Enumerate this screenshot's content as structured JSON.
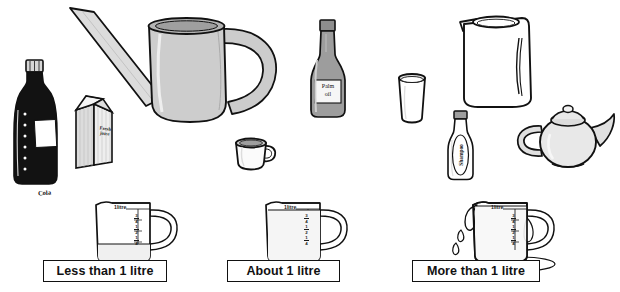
{
  "worksheet": {
    "title": "Capacity comparison worksheet",
    "unit": "litre"
  },
  "categories": [
    {
      "id": "less",
      "label": "Less than 1 litre",
      "jug_fill": "quarter",
      "overflowing": false
    },
    {
      "id": "about",
      "label": "About 1 litre",
      "jug_fill": "full",
      "overflowing": false
    },
    {
      "id": "more",
      "label": "More than 1 litre",
      "jug_fill": "overflow",
      "overflowing": true
    }
  ],
  "jug_scale": {
    "top_mark": "1litre",
    "marks": [
      {
        "num": "3",
        "den": "4"
      },
      {
        "num": "1",
        "den": "2"
      },
      {
        "num": "1",
        "den": "4"
      }
    ]
  },
  "objects": [
    {
      "id": "cola-bottle",
      "name": "Cola bottle",
      "label": "Cola",
      "color": "#111111"
    },
    {
      "id": "juice-carton",
      "name": "Juice carton",
      "label": "Fresh juice",
      "color": "#d9d9d9"
    },
    {
      "id": "watering-can",
      "name": "Watering can",
      "label": "",
      "color": "#cfcfcf"
    },
    {
      "id": "teacup",
      "name": "Teacup",
      "label": "",
      "color": "#ffffff"
    },
    {
      "id": "palm-oil-bottle",
      "name": "Palm oil bottle",
      "label": "Palm oil",
      "color": "#9a9a9a"
    },
    {
      "id": "drinking-glass",
      "name": "Drinking glass",
      "label": "",
      "color": "#ffffff"
    },
    {
      "id": "water-pitcher",
      "name": "Water pitcher",
      "label": "",
      "color": "#ffffff"
    },
    {
      "id": "shampoo-bottle",
      "name": "Shampoo bottle",
      "label": "Shampoo",
      "color": "#ffffff"
    },
    {
      "id": "teapot",
      "name": "Teapot",
      "label": "",
      "color": "#e6e6e6"
    }
  ],
  "palm_oil_lines": [
    "Palm",
    "oil"
  ],
  "juice_lines": [
    "Fresh",
    "juice"
  ],
  "colors": {
    "ink": "#111111",
    "paper": "#ffffff",
    "grey_mid": "#b8b8b8",
    "grey_light": "#e3e3e3",
    "grey_dark": "#8c8c8c"
  }
}
